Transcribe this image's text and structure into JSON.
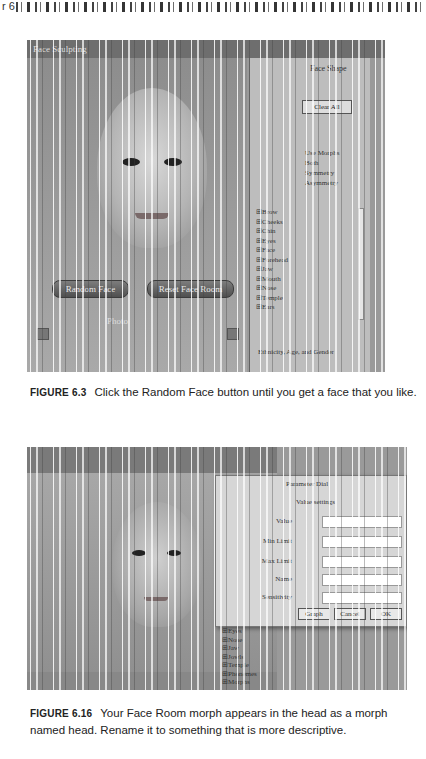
{
  "page_header": {
    "chapter_marker": "r 6"
  },
  "figure1": {
    "app": {
      "title": "Face Sculpting",
      "buttons": {
        "random_face": "Random Face",
        "reset_face_room": "Reset Face Room"
      },
      "photo_label": "Photo",
      "side_panel": {
        "tab_title": "Face Shape",
        "clear_button": "Clear All",
        "radio_group_label": "Use Morphs",
        "radio_options": [
          "Both",
          "Symmetry",
          "Asymmetry"
        ],
        "morph_list": [
          "Brow",
          "Cheeks",
          "Chin",
          "Eyes",
          "Face",
          "Forehead",
          "Jaw",
          "Mouth",
          "Nose",
          "Temple",
          "Ears"
        ],
        "footer": "Ethnicity, Age, and Gender"
      }
    },
    "caption": {
      "label": "FIGURE 6.3",
      "text": "Click the Random Face button until you get a face that you like."
    }
  },
  "figure2": {
    "app": {
      "dialog": {
        "title": "Parameter Dial",
        "subtitle": "Value settings",
        "fields": [
          {
            "label": "Value",
            "value": "0.000"
          },
          {
            "label": "Min Limit",
            "value": "-10.000"
          },
          {
            "label": "Max Limit",
            "value": "10.000"
          },
          {
            "label": "Name",
            "value": "FaceRoom"
          },
          {
            "label": "Sensitivity",
            "value": "0.005"
          }
        ],
        "buttons": {
          "graph": "Graph",
          "cancel": "Cancel",
          "ok": "OK"
        }
      },
      "morph_list": [
        "Eyes",
        "Nose",
        "Jaw",
        "Jowls",
        "Temple",
        "Phonemes",
        "Morphs"
      ]
    },
    "caption": {
      "label": "FIGURE 6.16",
      "text": "Your Face Room morph appears in the head as a morph named head. Rename it to something that is more descriptive."
    }
  }
}
